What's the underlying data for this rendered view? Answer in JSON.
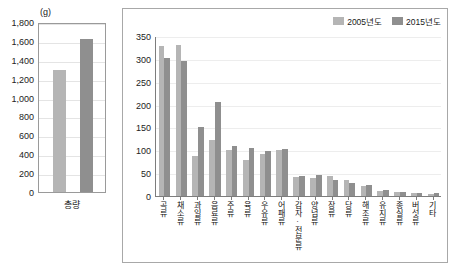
{
  "left_panel": {
    "unit_label": "(g)",
    "category_label": "총량",
    "y_ticks": [
      "1,800",
      "1,600",
      "1,400",
      "1,200",
      "1,000",
      "800",
      "600",
      "400",
      "200",
      "0"
    ]
  },
  "legend": {
    "items": [
      {
        "label": "2005년도",
        "color": "#b5b5b5"
      },
      {
        "label": "2015년도",
        "color": "#8f8f8f"
      }
    ]
  },
  "right_panel": {
    "y_ticks": [
      "350",
      "300",
      "250",
      "200",
      "150",
      "100",
      "50",
      "0"
    ]
  },
  "chart_data": [
    {
      "type": "bar",
      "title": "총량",
      "id": "total-intake",
      "xlabel": "",
      "ylabel": "(g)",
      "ylim": [
        0,
        1800
      ],
      "ytick_step": 200,
      "grid": true,
      "categories": [
        "총량"
      ],
      "series": [
        {
          "name": "2005년도",
          "color": "#b5b5b5",
          "values": [
            1290
          ]
        },
        {
          "name": "2015년도",
          "color": "#8f8f8f",
          "values": [
            1620
          ]
        }
      ]
    },
    {
      "type": "bar",
      "title": "",
      "id": "intake-by-food-group",
      "xlabel": "",
      "ylabel": "",
      "ylim": [
        0,
        350
      ],
      "ytick_step": 50,
      "grid": true,
      "legend_position": "top-right",
      "categories": [
        "곡류",
        "채소류",
        "과일류",
        "음료류",
        "주류",
        "육류",
        "우유류",
        "어패류",
        "감자·전분류",
        "양념류",
        "장류",
        "당류",
        "해조류",
        "유지류",
        "종실류",
        "버섯류",
        "기타"
      ],
      "series": [
        {
          "name": "2005년도",
          "color": "#b5b5b5",
          "values": [
            328,
            330,
            88,
            122,
            101,
            78,
            93,
            101,
            42,
            40,
            44,
            36,
            22,
            12,
            9,
            6,
            5
          ]
        },
        {
          "name": "2015년도",
          "color": "#8f8f8f",
          "values": [
            303,
            295,
            152,
            205,
            110,
            104,
            98,
            103,
            44,
            47,
            36,
            28,
            25,
            14,
            8,
            7,
            6
          ]
        }
      ]
    }
  ]
}
